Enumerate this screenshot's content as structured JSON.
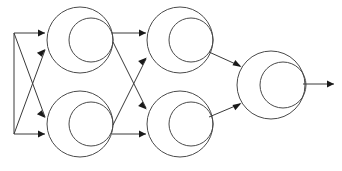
{
  "diagram": {
    "type": "feedforward-neural-network",
    "background_color": "#ffffff",
    "stroke_color": "#4a4a4a",
    "edge_color": "#3a3a3a",
    "arrow_color": "#1a1a1a",
    "canvas": {
      "width": 342,
      "height": 171
    },
    "layers": [
      {
        "name": "input-layer",
        "label": "Input",
        "node_count": 2,
        "nodes": [
          {
            "id": "input-1",
            "label": "",
            "x": 14,
            "y": 33
          },
          {
            "id": "input-2",
            "label": "",
            "x": 14,
            "y": 134
          }
        ]
      },
      {
        "name": "hidden-layer-1",
        "label": "Hidden Layer 1",
        "node_count": 2,
        "nodes": [
          {
            "id": "h1-1",
            "label": "",
            "cx": 80,
            "cy": 40,
            "r_outer": 33,
            "r_inner": 22,
            "inner_cx": 91,
            "inner_cy": 40
          },
          {
            "id": "h1-2",
            "label": "",
            "cx": 80,
            "cy": 124,
            "r_outer": 33,
            "r_inner": 22,
            "inner_cx": 91,
            "inner_cy": 124
          }
        ]
      },
      {
        "name": "hidden-layer-2",
        "label": "Hidden Layer 2",
        "node_count": 2,
        "nodes": [
          {
            "id": "h2-1",
            "label": "",
            "cx": 180,
            "cy": 40,
            "r_outer": 33,
            "r_inner": 22,
            "inner_cx": 191,
            "inner_cy": 40
          },
          {
            "id": "h2-2",
            "label": "",
            "cx": 180,
            "cy": 124,
            "r_outer": 33,
            "r_inner": 22,
            "inner_cx": 191,
            "inner_cy": 124
          }
        ]
      },
      {
        "name": "output-layer",
        "label": "Output",
        "node_count": 1,
        "nodes": [
          {
            "id": "out-1",
            "label": "",
            "cx": 271,
            "cy": 85,
            "r_outer": 34,
            "r_inner": 23,
            "inner_cx": 283,
            "inner_cy": 85
          }
        ]
      }
    ],
    "connections": [
      {
        "id": "in1-h1top",
        "from": "input-1",
        "to": "h1-1",
        "style": "straight"
      },
      {
        "id": "in1-h1bot",
        "from": "input-1",
        "to": "h1-2",
        "style": "crossing"
      },
      {
        "id": "in2-h1bot",
        "from": "input-2",
        "to": "h1-2",
        "style": "straight"
      },
      {
        "id": "in2-h1top",
        "from": "input-2",
        "to": "h1-1",
        "style": "crossing"
      },
      {
        "id": "h1top-h2top",
        "from": "h1-1",
        "to": "h2-1",
        "style": "straight"
      },
      {
        "id": "h1top-h2bot",
        "from": "h1-1",
        "to": "h2-2",
        "style": "crossing"
      },
      {
        "id": "h1bot-h2bot",
        "from": "h1-2",
        "to": "h2-2",
        "style": "straight"
      },
      {
        "id": "h1bot-h2top",
        "from": "h1-2",
        "to": "h2-1",
        "style": "crossing"
      },
      {
        "id": "h2top-out",
        "from": "h2-1",
        "to": "out-1",
        "style": "converging"
      },
      {
        "id": "h2bot-out",
        "from": "h2-2",
        "to": "out-1",
        "style": "converging"
      },
      {
        "id": "out-result",
        "from": "out-1",
        "to": "result",
        "style": "straight"
      }
    ]
  }
}
